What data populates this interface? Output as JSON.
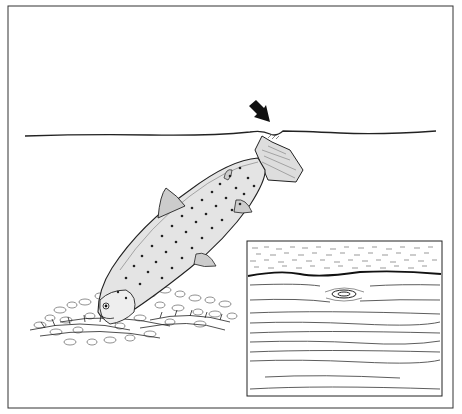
{
  "illustration": {
    "subject": "Trout feeding on bottom among stones and weed, with surface disturbance",
    "arrow": "arrow pointing to surface rise",
    "inset": "inset showing surface boil ring on water",
    "colors": {
      "background": "#ffffff",
      "ink": "#1a1a1a",
      "fish_fill": "#e8e8e8",
      "fish_back": "#b8b8b8"
    }
  }
}
